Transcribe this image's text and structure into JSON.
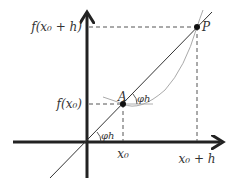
{
  "diagram": {
    "type": "secant-line-derivative",
    "labels": {
      "y_high": "f(x₀ + h)",
      "y_low": "f(x₀)",
      "x_low": "x₀",
      "x_high": "x₀ + h",
      "point_a": "A",
      "point_p": "P",
      "angle_at_a": "φh",
      "angle_at_origin": "φh"
    },
    "colors": {
      "axes": "#222222",
      "secant": "#333333",
      "curve": "#aaaaaa",
      "dashed": "#555555",
      "points": "#111111",
      "text": "#333333"
    }
  }
}
